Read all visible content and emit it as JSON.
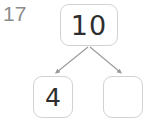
{
  "exercise": {
    "number_label": "17",
    "number_color": "#8c8c8c"
  },
  "diagram": {
    "type": "number-bond",
    "total": {
      "label": "10",
      "value": "10",
      "filled": true
    },
    "parts": [
      {
        "label": "4",
        "value": "4",
        "filled": true,
        "position": "left"
      },
      {
        "label": "",
        "value": "",
        "filled": false,
        "position": "right"
      }
    ],
    "connectors": [
      {
        "from": "total",
        "to": "part-left",
        "arrowhead": true
      },
      {
        "from": "total",
        "to": "part-right",
        "arrowhead": true
      }
    ],
    "colors": {
      "box_border": "#d2d2d2",
      "box_fill": "#ffffff",
      "digit": "#2e2e2e",
      "arrow": "#9a9a9a"
    }
  }
}
